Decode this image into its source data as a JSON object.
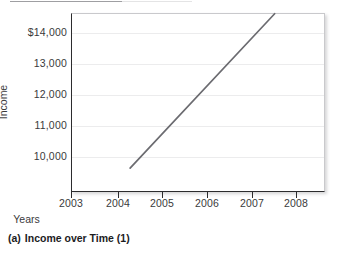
{
  "figure": {
    "caption_index": "(a)",
    "caption_text": "Income over Time (1)"
  },
  "chart_data": {
    "type": "line",
    "title": "",
    "xlabel": "Years",
    "ylabel": "Income",
    "grid": "horizontal",
    "legend": "none",
    "xlim": [
      2002.65,
      2008.45
    ],
    "ylim": [
      9640,
      14600
    ],
    "xticks": [
      2003,
      2004,
      2005,
      2006,
      2007,
      2008
    ],
    "xticklabels": [
      "2003",
      "2004",
      "2005",
      "2006",
      "2007",
      "2008"
    ],
    "yticks": [
      10000,
      11000,
      12000,
      13000,
      14000
    ],
    "yticklabels": [
      "10,000",
      "11,000",
      "12,000",
      "13,000",
      "$14,000"
    ],
    "series": [
      {
        "name": "Income",
        "color": "#6b6b70",
        "x": [
          2004.0,
          2007.3
        ],
        "values": [
          10300,
          14580
        ]
      }
    ]
  }
}
